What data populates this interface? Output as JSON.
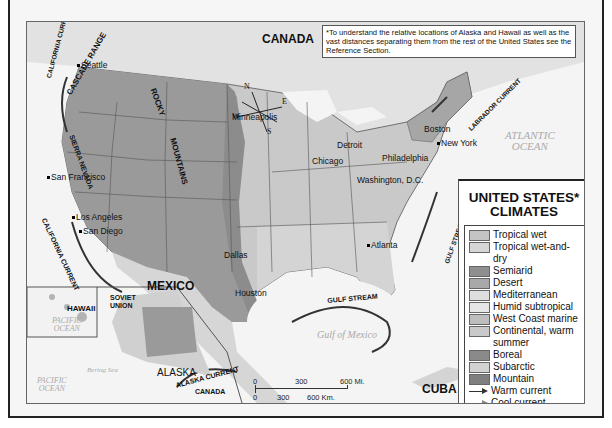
{
  "map": {
    "title": "UNITED STATES* CLIMATES",
    "title_line1": "UNITED STATES*",
    "title_line2": "CLIMATES",
    "note": "*To understand the relative locations of Alaska and Hawaii as well as the vast distances separating them from the rest of the United States see the Reference Section.",
    "countries": {
      "canada": "CANADA",
      "mexico": "MEXICO",
      "cuba": "CUBA",
      "alaska": "ALASKA",
      "hawaii": "HAWAII",
      "soviet_union": "SOVIET UNION",
      "canada_inset": "CANADA"
    },
    "mountains": {
      "cascade": "CASCADE RANGE",
      "sierra": "SIERRA NEVADA",
      "rocky": "ROCKY",
      "mountains": "MOUNTAINS"
    },
    "cities": {
      "seattle": "Seattle",
      "san_francisco": "San Francisco",
      "los_angeles": "Los Angeles",
      "san_diego": "San Diego",
      "minneapolis": "Minneapolis",
      "chicago": "Chicago",
      "detroit": "Detroit",
      "boston": "Boston",
      "new_york": "New York",
      "philadelphia": "Philadelphia",
      "washington": "Washington, D.C.",
      "atlanta": "Atlanta",
      "dallas": "Dallas",
      "houston": "Houston"
    },
    "currents": {
      "california_top": "CALIFORNIA CURRENT",
      "california_bottom": "CALIFORNIA CURRENT",
      "labrador": "LABRADOR CURRENT",
      "gulf_stream_east": "GULF STREAM",
      "gulf_stream_gulf": "GULF STREAM",
      "alaska": "ALASKA CURRENT"
    },
    "water": {
      "atlantic_1": "ATLANTIC",
      "atlantic_2": "OCEAN",
      "gulf": "Gulf of Mexico",
      "pacific_1": "PACIFIC",
      "pacific_2": "OCEAN",
      "bering": "Bering Sea"
    },
    "longitudes": [
      "120°",
      "110°",
      "90°",
      "80°",
      "100°",
      "160°",
      "140°",
      "40°",
      "30°",
      "20°"
    ],
    "compass": {
      "n": "N",
      "s": "S",
      "e": "E",
      "w": "W"
    },
    "scale": {
      "mi_labels": [
        "0",
        "300",
        "600 Mi."
      ],
      "km_labels": [
        "0",
        "300",
        "600 Km."
      ]
    }
  },
  "legend": {
    "items": [
      {
        "label": "Tropical wet",
        "color": "#c4c4c4"
      },
      {
        "label": "Tropical wet-and-dry",
        "color": "#d6d6d6"
      },
      {
        "label": "Semiarid",
        "color": "#8f8f8f"
      },
      {
        "label": "Desert",
        "color": "#a9a9a9"
      },
      {
        "label": "Mediterranean",
        "color": "#dedede"
      },
      {
        "label": "Humid subtropical",
        "color": "#e6e6e6"
      },
      {
        "label": "West Coast marine",
        "color": "#bdbdbd"
      },
      {
        "label": "Continental, warm summer",
        "color": "#c9c9c9"
      },
      {
        "label": "Boreal",
        "color": "#8a8a8a"
      },
      {
        "label": "Subarctic",
        "color": "#d2d2d2"
      },
      {
        "label": "Mountain",
        "color": "#7f7f7f"
      }
    ],
    "warm_current": "Warm current",
    "cool_current": "Cool current",
    "projection": "Albers Equal-Area Projection"
  }
}
